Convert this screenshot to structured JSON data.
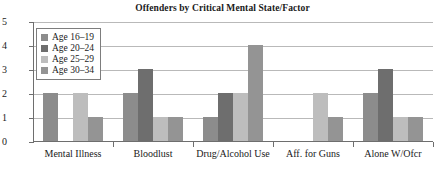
{
  "chart_data": {
    "type": "bar",
    "title": "Offenders by Critical Mental State/Factor",
    "xlabel": "",
    "ylabel": "",
    "ylim": [
      0,
      5
    ],
    "yticks": [
      "0",
      "1",
      "2",
      "3",
      "4",
      "5"
    ],
    "grid": true,
    "legend_position": "upper-left-inside",
    "categories": [
      "Mental Illness",
      "Bloodlust",
      "Drug/Alcohol Use",
      "Aff. for Guns",
      "Alone W/Ofcr"
    ],
    "series": [
      {
        "name": "Age 16–19",
        "color": "#8c8c8c",
        "values": [
          2,
          2,
          1,
          0,
          2
        ]
      },
      {
        "name": "Age 20–24",
        "color": "#6e6e6e",
        "values": [
          0,
          3,
          2,
          0,
          3
        ]
      },
      {
        "name": "Age 25–29",
        "color": "#bdbdbd",
        "values": [
          2,
          1,
          2,
          2,
          1
        ]
      },
      {
        "name": "Age 30–34",
        "color": "#949494",
        "values": [
          1,
          1,
          4,
          1,
          1
        ]
      }
    ]
  },
  "axis": {
    "frame_color": "#6e6e6e",
    "grid_color": "#b9b9b9"
  }
}
